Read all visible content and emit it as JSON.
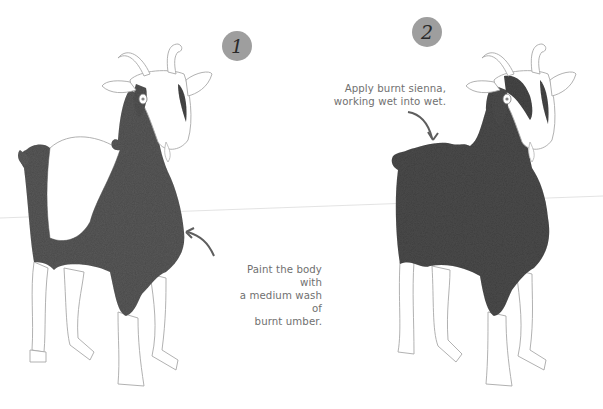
{
  "steps": [
    {
      "number": "1",
      "caption_lines": [
        "Paint the body with",
        "a medium wash of",
        "burnt umber."
      ]
    },
    {
      "number": "2",
      "caption_lines": [
        "Apply burnt sienna,",
        "working wet into wet."
      ]
    }
  ],
  "colors": {
    "badge": "#9e9e9e",
    "paint_step1": "#5a5a5a",
    "paint_step2": "#4e4e4e",
    "outline": "#9a9a9a",
    "caption_text": "#707070",
    "arrow": "#5e5e5e"
  }
}
